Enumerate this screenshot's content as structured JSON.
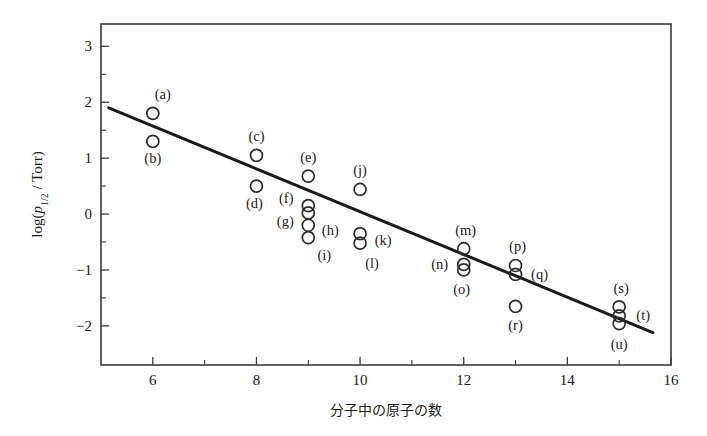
{
  "chart_data": {
    "type": "scatter",
    "title": "",
    "xlabel": "分子中の原子の数",
    "ylabel": "log(p1/2 / Torr)",
    "ylabel_parts": {
      "log_open": "log(",
      "p": "p",
      "sub": "1/2",
      "slash": " / Torr)"
    },
    "xlim": [
      5,
      16
    ],
    "ylim": [
      -2.7,
      3.4
    ],
    "xticks": [
      6,
      8,
      10,
      12,
      14,
      16
    ],
    "xtick_labels": [
      "6",
      "8",
      "10",
      "12",
      "14",
      "16"
    ],
    "xminor": [
      7,
      9,
      11,
      13,
      15
    ],
    "yticks": [
      3,
      2,
      1,
      0,
      -1,
      -2
    ],
    "ytick_labels": [
      "3",
      "2",
      "1",
      "0",
      "−1",
      "−2"
    ],
    "yminor": [
      2.5,
      1.5,
      0.5,
      -0.5,
      -1.5
    ],
    "grid": false,
    "legend": "none",
    "frame": "box",
    "marker": "open-circle",
    "marker_radius_px": 6,
    "fit_line": {
      "label": "regression-line",
      "x_start": 5.15,
      "y_start": 1.9,
      "x_end": 15.65,
      "y_end": -2.12,
      "color": "#1a1a1a"
    },
    "points": [
      {
        "label": "(a)",
        "x": 6,
        "y": 1.8,
        "label_dx": 10,
        "label_dy": -14
      },
      {
        "label": "(b)",
        "x": 6,
        "y": 1.3,
        "label_dx": 0,
        "label_dy": 22
      },
      {
        "label": "(c)",
        "x": 8,
        "y": 1.05,
        "label_dx": 0,
        "label_dy": -14
      },
      {
        "label": "(d)",
        "x": 8,
        "y": 0.5,
        "label_dx": -2,
        "label_dy": 22
      },
      {
        "label": "(e)",
        "x": 9,
        "y": 0.68,
        "label_dx": 0,
        "label_dy": -14
      },
      {
        "label": "(f)",
        "x": 9,
        "y": 0.15,
        "label_dx": -22,
        "label_dy": -3
      },
      {
        "label": "(g)",
        "x": 9,
        "y": 0.02,
        "label_dx": -23,
        "label_dy": 13
      },
      {
        "label": "(h)",
        "x": 9,
        "y": -0.2,
        "label_dx": 22,
        "label_dy": 10
      },
      {
        "label": "(i)",
        "x": 9,
        "y": -0.42,
        "label_dx": 16,
        "label_dy": 22
      },
      {
        "label": "(j)",
        "x": 10,
        "y": 0.44,
        "label_dx": 0,
        "label_dy": -14
      },
      {
        "label": "(k)",
        "x": 10,
        "y": -0.35,
        "label_dx": 23,
        "label_dy": 11
      },
      {
        "label": "(l)",
        "x": 10,
        "y": -0.52,
        "label_dx": 12,
        "label_dy": 25
      },
      {
        "label": "(m)",
        "x": 12,
        "y": -0.62,
        "label_dx": 2,
        "label_dy": -14
      },
      {
        "label": "(n)",
        "x": 12,
        "y": -0.9,
        "label_dx": -24,
        "label_dy": 5
      },
      {
        "label": "(o)",
        "x": 12,
        "y": -1.0,
        "label_dx": -2,
        "label_dy": 24
      },
      {
        "label": "(p)",
        "x": 13,
        "y": -0.92,
        "label_dx": 2,
        "label_dy": -14
      },
      {
        "label": "(q)",
        "x": 13,
        "y": -1.08,
        "label_dx": 24,
        "label_dy": 5
      },
      {
        "label": "(r)",
        "x": 13,
        "y": -1.65,
        "label_dx": 0,
        "label_dy": 24
      },
      {
        "label": "(s)",
        "x": 15,
        "y": -1.66,
        "label_dx": 2,
        "label_dy": -14
      },
      {
        "label": "(t)",
        "x": 15,
        "y": -1.82,
        "label_dx": 24,
        "label_dy": 4
      },
      {
        "label": "(u)",
        "x": 15,
        "y": -1.96,
        "label_dx": 0,
        "label_dy": 25
      }
    ]
  }
}
